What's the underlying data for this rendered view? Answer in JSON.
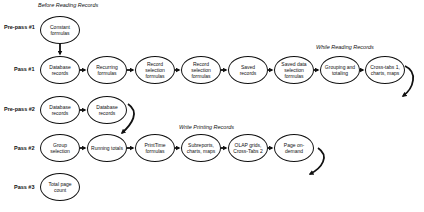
{
  "sections": {
    "before_reading": "Before Reading Records",
    "while_reading": "While Reading Records",
    "while_printing": "Write Printing Records"
  },
  "rows": [
    {
      "label": "Pre-pass #1",
      "nodes": [
        "Constant formulas"
      ]
    },
    {
      "label": "Pass #1",
      "nodes": [
        "Database records",
        "Recurring formulas",
        "Record selection formulas",
        "Record selection formulas",
        "Saved records",
        "Saved data selection formulas",
        "Grouping and totaling",
        "Cross-tabs 1, charts, maps"
      ]
    },
    {
      "label": "Pre-pass #2",
      "nodes": [
        "Database records",
        "Database records"
      ]
    },
    {
      "label": "Pass #2",
      "nodes": [
        "Group selection",
        "Running totals",
        "PrintTime formulas",
        "Subreports, charts, maps",
        "OLAP grids, Cross-Tabs 2",
        "Page on-demand"
      ]
    },
    {
      "label": "Pass #3",
      "nodes": [
        "Total page count"
      ]
    }
  ],
  "colors": {
    "stroke": "#111111",
    "background": "#ffffff"
  }
}
